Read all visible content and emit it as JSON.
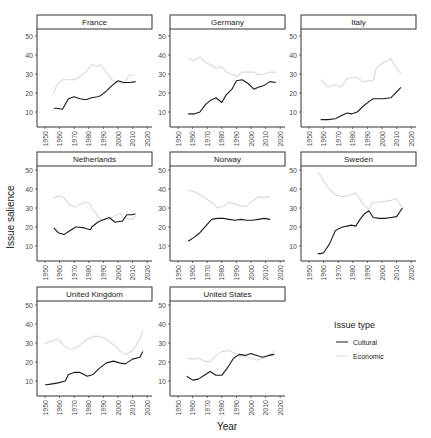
{
  "chart_data": {
    "type": "line",
    "title": "",
    "xlabel": "Year",
    "ylabel": "Issue salience",
    "xlim": [
      1945,
      2022
    ],
    "ylim": [
      2,
      54
    ],
    "x_ticks": [
      1950,
      1960,
      1970,
      1980,
      1990,
      2000,
      2010,
      2020
    ],
    "y_ticks": [
      10,
      20,
      30,
      40,
      50
    ],
    "grid": false,
    "legend": {
      "title": "Issue type",
      "position": "right-bottom",
      "entries": [
        {
          "name": "Cultural",
          "color": "#1a1a1a"
        },
        {
          "name": "Economic",
          "color": "#d9d9d9"
        }
      ]
    },
    "panels": [
      {
        "name": "France",
        "series": [
          {
            "name": "Cultural",
            "x": [
              1956,
              1958,
              1962,
              1966,
              1970,
              1974,
              1978,
              1982,
              1986,
              1988,
              1992,
              1996,
              2000,
              2004,
              2008,
              2012
            ],
            "y": [
              12,
              12,
              11.5,
              17,
              18,
              17,
              16.5,
              17.5,
              18,
              18.5,
              21,
              24,
              26.5,
              25.5,
              25.5,
              26
            ]
          },
          {
            "name": "Economic",
            "x": [
              1956,
              1958,
              1962,
              1966,
              1970,
              1974,
              1978,
              1982,
              1986,
              1988,
              1992,
              1996,
              2000,
              2004,
              2008,
              2012
            ],
            "y": [
              20,
              24,
              27,
              27,
              27,
              28.5,
              31,
              35,
              34,
              35,
              31,
              27,
              25.5,
              25,
              29.5,
              29.5
            ]
          }
        ]
      },
      {
        "name": "Germany",
        "series": [
          {
            "name": "Cultural",
            "x": [
              1957,
              1961,
              1965,
              1969,
              1972,
              1976,
              1980,
              1983,
              1987,
              1990,
              1994,
              1998,
              2002,
              2005,
              2009,
              2013,
              2017
            ],
            "y": [
              9,
              9,
              10,
              14,
              16,
              17.5,
              15,
              19,
              22,
              26.5,
              27,
              25,
              22,
              23,
              24,
              26,
              25.5
            ]
          },
          {
            "name": "Economic",
            "x": [
              1957,
              1961,
              1965,
              1969,
              1972,
              1976,
              1980,
              1983,
              1987,
              1990,
              1994,
              1998,
              2002,
              2005,
              2009,
              2013,
              2017
            ],
            "y": [
              38,
              37,
              39,
              36,
              35,
              33,
              34,
              31,
              30,
              28.5,
              31,
              31,
              31,
              29.5,
              30,
              31,
              31
            ]
          }
        ]
      },
      {
        "name": "Italy",
        "series": [
          {
            "name": "Cultural",
            "x": [
              1958,
              1963,
              1968,
              1972,
              1976,
              1979,
              1983,
              1987,
              1992,
              1994,
              1996,
              2001,
              2006,
              2008,
              2013
            ],
            "y": [
              6,
              6,
              6.5,
              8,
              9.5,
              9,
              10,
              13,
              16,
              17,
              17,
              17,
              17.5,
              19,
              23
            ]
          },
          {
            "name": "Economic",
            "x": [
              1958,
              1963,
              1968,
              1972,
              1976,
              1979,
              1983,
              1987,
              1992,
              1994,
              1996,
              2001,
              2006,
              2008,
              2013
            ],
            "y": [
              27,
              23,
              24.5,
              23,
              27.5,
              28,
              28,
              26,
              26.5,
              26.5,
              33,
              36,
              38,
              35,
              30
            ]
          }
        ]
      },
      {
        "name": "Netherlands",
        "series": [
          {
            "name": "Cultural",
            "x": [
              1956,
              1959,
              1963,
              1967,
              1971,
              1972,
              1977,
              1981,
              1982,
              1986,
              1989,
              1994,
              1998,
              2002,
              2003,
              2006,
              2010,
              2012
            ],
            "y": [
              19.5,
              17,
              16,
              18,
              20,
              20,
              19.5,
              18.5,
              20,
              22.5,
              23.5,
              25,
              22.5,
              23,
              23,
              26.5,
              26.5,
              27
            ]
          },
          {
            "name": "Economic",
            "x": [
              1956,
              1959,
              1963,
              1967,
              1971,
              1972,
              1977,
              1981,
              1982,
              1986,
              1989,
              1994,
              1998,
              2002,
              2003,
              2006,
              2010,
              2012
            ],
            "y": [
              35,
              36.5,
              35.5,
              31.5,
              30.5,
              31,
              33,
              32.5,
              30,
              26,
              23.5,
              24,
              26,
              27,
              25,
              24.5,
              24,
              26
            ]
          }
        ]
      },
      {
        "name": "Norway",
        "series": [
          {
            "name": "Cultural",
            "x": [
              1957,
              1961,
              1965,
              1969,
              1973,
              1977,
              1981,
              1985,
              1989,
              1993,
              1997,
              2001,
              2005,
              2009,
              2013
            ],
            "y": [
              12.5,
              14.5,
              17,
              20.5,
              24,
              24.5,
              24.5,
              24,
              23.5,
              24,
              23.5,
              23.5,
              24,
              24.5,
              24
            ]
          },
          {
            "name": "Economic",
            "x": [
              1957,
              1961,
              1965,
              1969,
              1973,
              1977,
              1981,
              1985,
              1989,
              1993,
              1997,
              2001,
              2005,
              2009,
              2013
            ],
            "y": [
              39.5,
              38.5,
              37,
              35,
              33,
              30,
              31,
              33,
              32,
              31,
              31,
              33.5,
              36,
              35.5,
              36
            ]
          }
        ]
      },
      {
        "name": "Sweden",
        "series": [
          {
            "name": "Cultural",
            "x": [
              1956,
              1958,
              1960,
              1964,
              1968,
              1970,
              1973,
              1976,
              1979,
              1982,
              1985,
              1988,
              1991,
              1994,
              1998,
              2002,
              2006,
              2010,
              2014
            ],
            "y": [
              6,
              6,
              6.5,
              11,
              18,
              19,
              20,
              20.5,
              21,
              20.5,
              24,
              27,
              28.5,
              25,
              24.5,
              24.5,
              25,
              25.5,
              30
            ]
          },
          {
            "name": "Economic",
            "x": [
              1956,
              1958,
              1960,
              1964,
              1968,
              1970,
              1973,
              1976,
              1979,
              1982,
              1985,
              1988,
              1991,
              1994,
              1998,
              2002,
              2006,
              2010,
              2014
            ],
            "y": [
              48.5,
              47,
              44,
              40,
              37,
              36.5,
              36,
              36.5,
              37,
              38,
              34.5,
              31,
              29.5,
              33,
              33,
              33.5,
              34,
              35,
              30
            ]
          }
        ]
      },
      {
        "name": "United Kingdom",
        "series": [
          {
            "name": "Cultural",
            "x": [
              1950,
              1951,
              1955,
              1959,
              1964,
              1966,
              1970,
              1974,
              1979,
              1983,
              1987,
              1992,
              1997,
              2001,
              2005,
              2010,
              2015,
              2017
            ],
            "y": [
              8,
              8,
              8.5,
              9,
              10,
              13.5,
              14.5,
              14.5,
              12.5,
              13.5,
              16.5,
              19.5,
              20.5,
              19.5,
              19,
              21.5,
              22.5,
              25.5
            ]
          },
          {
            "name": "Economic",
            "x": [
              1950,
              1951,
              1955,
              1959,
              1964,
              1966,
              1970,
              1974,
              1979,
              1983,
              1987,
              1992,
              1997,
              2001,
              2005,
              2010,
              2015,
              2017
            ],
            "y": [
              29.5,
              30,
              31,
              32,
              28,
              27,
              27,
              29,
              32,
              33.5,
              33.5,
              32,
              29,
              26,
              24,
              26,
              32,
              36.5
            ]
          }
        ]
      },
      {
        "name": "United States",
        "series": [
          {
            "name": "Cultural",
            "x": [
              1956,
              1960,
              1964,
              1968,
              1972,
              1976,
              1980,
              1984,
              1988,
              1992,
              1996,
              2000,
              2004,
              2008,
              2012,
              2016
            ],
            "y": [
              12.5,
              10.5,
              11,
              13,
              15,
              13,
              13,
              17,
              22,
              24,
              23.5,
              24.5,
              23.5,
              22.5,
              23.5,
              24
            ]
          },
          {
            "name": "Economic",
            "x": [
              1956,
              1960,
              1964,
              1968,
              1972,
              1976,
              1980,
              1984,
              1988,
              1992,
              1996,
              2000,
              2004,
              2008,
              2012,
              2016
            ],
            "y": [
              22,
              21.5,
              22,
              20.5,
              20,
              23.5,
              25.5,
              26,
              25,
              23,
              23,
              22,
              21,
              22,
              23,
              26
            ]
          }
        ]
      }
    ]
  }
}
